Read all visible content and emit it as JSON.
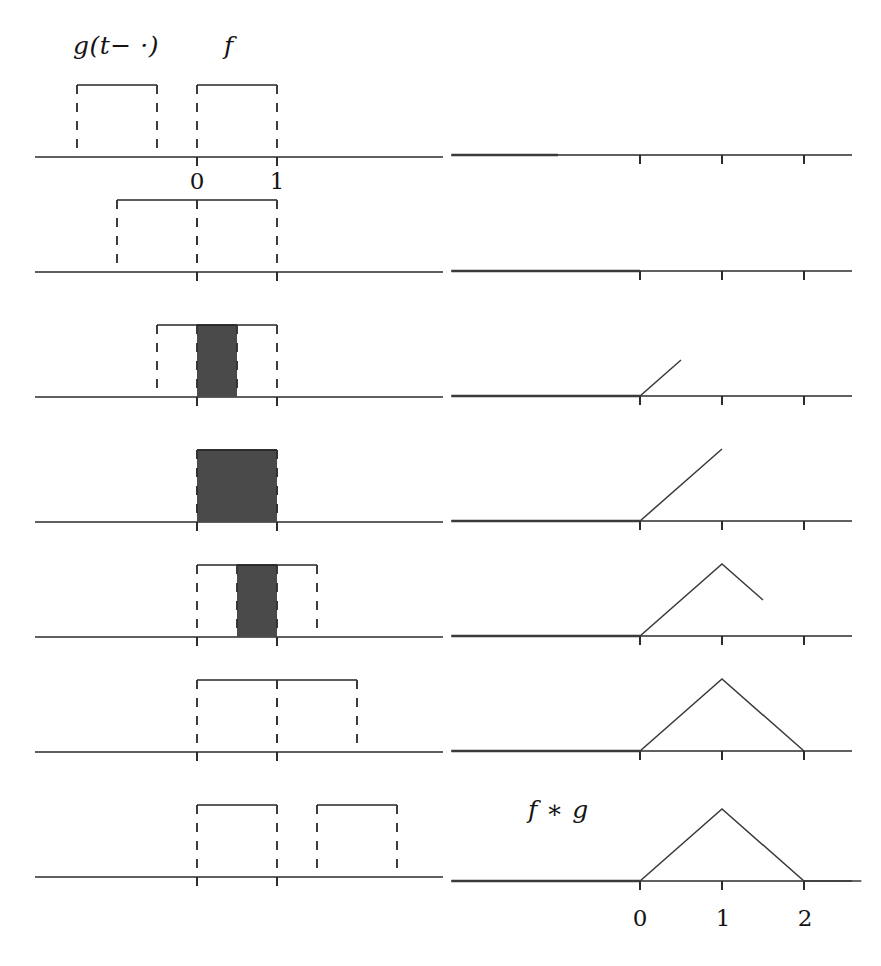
{
  "figure": {
    "title_alt": "Convolution of two box functions",
    "colors": {
      "ink": "#262626",
      "axis": "#2b2b2b",
      "dash": "#333333",
      "shade": "#4a4a4a",
      "curve": "#3a3a3a"
    },
    "labels": {
      "g_shifted": "g(t− ·)",
      "f": "f",
      "convolution": "f ∗ g"
    },
    "left_axis_ticks": [
      "0",
      "1"
    ],
    "right_axis_ticks": [
      "0",
      "1",
      "2"
    ]
  },
  "chart_data": {
    "type": "line",
    "xlabel": "",
    "ylabel": "",
    "grid": false,
    "legend": "none",
    "rows": 7,
    "left_column": {
      "description": "Sliding box g(t-·) against fixed box f on a shared t-axis",
      "xlim": [
        -2.0,
        2.6
      ],
      "box_width": 1.0,
      "box_height": 1.0,
      "fixed_box_f": {
        "start": 0.0,
        "end": 1.0,
        "label": "f"
      },
      "frames": [
        {
          "row": 1,
          "t": 0.0,
          "g_start": -1.5,
          "g_end": -0.5,
          "overlap_start": null,
          "overlap_end": null,
          "overlap_width": 0.0
        },
        {
          "row": 2,
          "t": 1.0,
          "g_start": -1.0,
          "g_end": 0.0,
          "overlap_start": null,
          "overlap_end": null,
          "overlap_width": 0.0
        },
        {
          "row": 3,
          "t": 1.5,
          "g_start": -0.5,
          "g_end": 0.5,
          "overlap_start": 0.0,
          "overlap_end": 0.5,
          "overlap_width": 0.5
        },
        {
          "row": 4,
          "t": 2.0,
          "g_start": 0.0,
          "g_end": 1.0,
          "overlap_start": 0.0,
          "overlap_end": 1.0,
          "overlap_width": 1.0
        },
        {
          "row": 5,
          "t": 2.5,
          "g_start": 0.5,
          "g_end": 1.5,
          "overlap_start": 0.5,
          "overlap_end": 1.0,
          "overlap_width": 0.5
        },
        {
          "row": 6,
          "t": 3.0,
          "g_start": 1.0,
          "g_end": 2.0,
          "overlap_start": null,
          "overlap_end": null,
          "overlap_width": 0.0
        },
        {
          "row": 7,
          "t": 3.5,
          "g_start": 1.5,
          "g_end": 2.5,
          "overlap_start": null,
          "overlap_end": null,
          "overlap_width": 0.0
        }
      ]
    },
    "right_column": {
      "description": "Partial traces of the convolution f*g, drawn up to the current t",
      "xlim": [
        -2.3,
        2.7
      ],
      "ylim": [
        0,
        1.15
      ],
      "tick_values": [
        0,
        1,
        2
      ],
      "final_curve": {
        "x": [
          -2.3,
          0,
          1,
          2,
          2.7
        ],
        "y": [
          0,
          0,
          1,
          0,
          0
        ]
      },
      "frames": [
        {
          "row": 1,
          "drawn_to_x": -1.0,
          "x": [
            -2.3,
            -1.0
          ],
          "y": [
            0,
            0
          ]
        },
        {
          "row": 2,
          "drawn_to_x": 0.0,
          "x": [
            -2.3,
            0.0
          ],
          "y": [
            0,
            0
          ]
        },
        {
          "row": 3,
          "drawn_to_x": 0.5,
          "x": [
            -2.3,
            0.0,
            0.5
          ],
          "y": [
            0,
            0,
            0.5
          ]
        },
        {
          "row": 4,
          "drawn_to_x": 1.0,
          "x": [
            -2.3,
            0.0,
            1.0
          ],
          "y": [
            0,
            0,
            1.0
          ]
        },
        {
          "row": 5,
          "drawn_to_x": 1.5,
          "x": [
            -2.3,
            0.0,
            1.0,
            1.5
          ],
          "y": [
            0,
            0,
            1.0,
            0.5
          ]
        },
        {
          "row": 6,
          "drawn_to_x": 2.0,
          "x": [
            -2.3,
            0.0,
            1.0,
            2.0
          ],
          "y": [
            0,
            0,
            1.0,
            0
          ]
        },
        {
          "row": 7,
          "drawn_to_x": 2.7,
          "x": [
            -2.3,
            0.0,
            1.0,
            2.0,
            2.7
          ],
          "y": [
            0,
            0,
            1.0,
            0,
            0
          ]
        }
      ]
    }
  }
}
